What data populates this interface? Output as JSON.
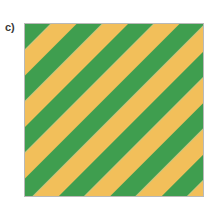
{
  "figure": {
    "panel_label": "c)",
    "pattern": {
      "type": "diagonal-stripes",
      "direction": "top-left to bottom-right",
      "angle_deg": 45,
      "colors": {
        "stripe_a": "#3f9e4f",
        "stripe_b": "#f2bf5a",
        "border": "#b9b9b9"
      },
      "stripe_a_name": "green",
      "stripe_b_name": "yellow"
    }
  }
}
